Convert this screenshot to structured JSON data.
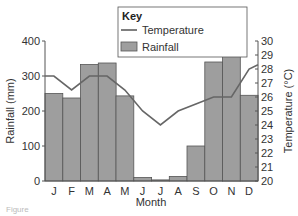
{
  "chart_data": {
    "type": "bar+line",
    "title": "",
    "xlabel": "Month",
    "categories": [
      "J",
      "F",
      "M",
      "A",
      "M",
      "J",
      "J",
      "A",
      "S",
      "O",
      "N",
      "D"
    ],
    "series": [
      {
        "name": "Rainfall",
        "type": "bar",
        "axis": "left",
        "unit": "mm",
        "values": [
          250,
          237,
          333,
          337,
          243,
          10,
          3,
          13,
          100,
          340,
          365,
          245
        ]
      },
      {
        "name": "Temperature",
        "type": "line",
        "axis": "right",
        "unit": "°C",
        "values": [
          27.5,
          26.5,
          27.5,
          27.5,
          26.5,
          25,
          24,
          25,
          25.5,
          26,
          26,
          28
        ]
      }
    ],
    "left_axis": {
      "label": "Rainfall (mm)",
      "ylim": [
        0,
        400
      ],
      "ticks": [
        "0",
        "100",
        "200",
        "300",
        "400"
      ]
    },
    "right_axis": {
      "label": "Temperature (°C)",
      "ylim": [
        20,
        30
      ],
      "ticks": [
        "20",
        "21",
        "22",
        "23",
        "24",
        "25",
        "26",
        "27",
        "28",
        "29",
        "30"
      ]
    },
    "legend": {
      "title": "Key",
      "position": "top-right",
      "entries": [
        "Temperature",
        "Rainfall"
      ]
    },
    "grid": false
  },
  "labels": {
    "key_title": "Key",
    "key_temperature": "Temperature",
    "key_rainfall": "Rainfall",
    "x_title": "Month",
    "y_left_title": "Rainfall (mm)",
    "y_right_title": "Temperature (°C)",
    "caption": "Figure"
  },
  "colors": {
    "bar_fill": "#9e9e9e",
    "bar_stroke": "#555555",
    "line": "#666666",
    "axis": "#555555"
  }
}
